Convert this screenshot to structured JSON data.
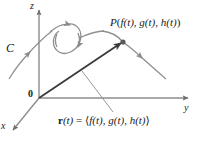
{
  "figure": {
    "background_color": "#ffffff",
    "axis_color": "#8c8c8c",
    "curve_color": "#7f7f7f",
    "vector_color": "#3a3a3a",
    "text_color": "#1a1a1a",
    "width": 199,
    "height": 142
  },
  "axes": {
    "z_label": "z",
    "y_label": "y",
    "x_label": "x",
    "origin_label": "0"
  },
  "curve": {
    "label": "C",
    "description": "looping space curve with direction arrows"
  },
  "point": {
    "label_P": "P",
    "label_paren_open": "(",
    "label_f": "f",
    "label_t1": "(t)",
    "label_comma1": ", ",
    "label_g": "g",
    "label_t2": "(t)",
    "label_comma2": ", ",
    "label_h": "h",
    "label_t3": "(t)",
    "label_paren_close": ")",
    "full_text": "P( f(t), g(t), h(t))"
  },
  "vector": {
    "label_r": "r",
    "label_t": "(t)",
    "label_eq": " = ",
    "label_angle_open": "⟨",
    "label_f": "f",
    "label_t1": "(t)",
    "label_comma1": ", ",
    "label_g": "g",
    "label_t2": "(t)",
    "label_comma2": ", ",
    "label_h": "h",
    "label_t3": "(t)",
    "label_angle_close": "⟩",
    "full_text": "r(t) = ⟨f(t), g(t), h(t)⟩"
  }
}
